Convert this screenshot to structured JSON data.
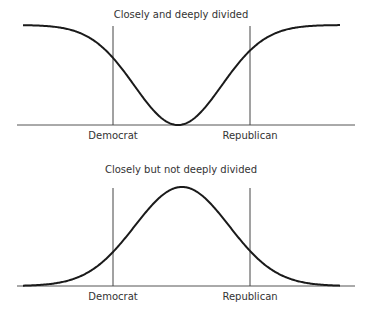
{
  "chart_data": [
    {
      "type": "line",
      "title": "Closely and deeply divided",
      "xlabel": "",
      "ylabel": "",
      "shape": "inverted-bell (bimodal, valley in center)",
      "markers": [
        "Democrat",
        "Republican"
      ],
      "x": [
        0,
        10,
        20,
        30,
        40,
        50,
        60,
        70,
        80,
        90,
        100
      ],
      "values": [
        1.0,
        0.99,
        0.93,
        0.72,
        0.38,
        0.0,
        0.38,
        0.72,
        0.93,
        0.99,
        1.0
      ],
      "grid": false,
      "legend": "none"
    },
    {
      "type": "line",
      "title": "Closely but not deeply divided",
      "xlabel": "",
      "ylabel": "",
      "shape": "bell curve (unimodal, peak in center)",
      "markers": [
        "Democrat",
        "Republican"
      ],
      "x": [
        0,
        10,
        20,
        30,
        40,
        50,
        60,
        70,
        80,
        90,
        100
      ],
      "values": [
        0.0,
        0.01,
        0.06,
        0.28,
        0.66,
        1.0,
        0.66,
        0.28,
        0.06,
        0.01,
        0.0
      ],
      "grid": false,
      "legend": "none"
    }
  ],
  "panels": [
    {
      "title": "Closely and deeply divided",
      "left_marker_label": "Democrat",
      "right_marker_label": "Republican",
      "geom": {
        "title_y": 18,
        "baseline_y": 125,
        "baseline_x1": 17,
        "baseline_x2": 355,
        "curve_x1": 23,
        "curve_x2": 340,
        "center_x": 178,
        "sigma": 43.6,
        "amplitude": 100,
        "inverted": true,
        "marker_top_y": 26,
        "left_marker_x": 113,
        "right_marker_x": 250,
        "label_y": 139
      }
    },
    {
      "title": "Closely but not deeply divided",
      "left_marker_label": "Democrat",
      "right_marker_label": "Republican",
      "geom": {
        "title_y": 173,
        "baseline_y": 286,
        "baseline_x1": 17,
        "baseline_x2": 355,
        "curve_x1": 23,
        "curve_x2": 340,
        "center_x": 182,
        "sigma": 47.2,
        "amplitude": 99,
        "inverted": false,
        "marker_top_y": 188,
        "left_marker_x": 113,
        "right_marker_x": 250,
        "label_y": 300
      }
    }
  ],
  "colors": {
    "curve": "#1a1a1a",
    "lines": "#444444",
    "text": "#333333",
    "background": "#ffffff"
  }
}
